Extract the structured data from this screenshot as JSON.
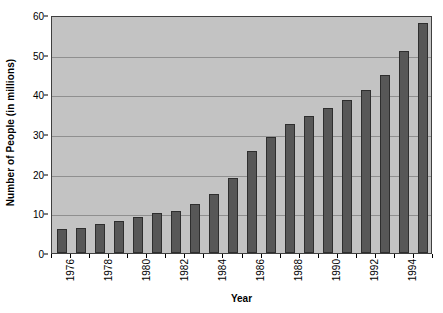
{
  "chart_data": {
    "type": "bar",
    "title": "",
    "xlabel": "Year",
    "ylabel": "Number of People (in millions)",
    "categories": [
      "1976",
      "1977",
      "1978",
      "1979",
      "1980",
      "1981",
      "1982",
      "1983",
      "1984",
      "1985",
      "1986",
      "1987",
      "1988",
      "1989",
      "1990",
      "1991",
      "1992",
      "1993",
      "1994",
      "1995"
    ],
    "values": [
      6.0,
      6.3,
      7.3,
      8.0,
      9.0,
      10.0,
      10.6,
      12.3,
      15.0,
      19.0,
      25.6,
      29.3,
      32.6,
      34.6,
      36.5,
      38.5,
      41.2,
      45.0,
      51.0,
      58.0
    ],
    "ylim": [
      0,
      60
    ],
    "y_ticks": [
      0,
      10,
      20,
      30,
      40,
      50,
      60
    ],
    "y_tick_labels": [
      "0",
      "10",
      "20",
      "30",
      "40",
      "50",
      "60"
    ],
    "x_tick_labels_shown": [
      "1976",
      "1978",
      "1980",
      "1982",
      "1984",
      "1986",
      "1988",
      "1990",
      "1992",
      "1994"
    ],
    "x_tick_label_indices": [
      0,
      2,
      4,
      6,
      8,
      10,
      12,
      14,
      16,
      18
    ],
    "grid": true,
    "legend": null,
    "legend_position": "none",
    "colors": {
      "bar_fill": "#575757",
      "bar_border": "#2e2e2e",
      "plot_background": "#c3c3c3",
      "plot_border": "#3f3f3f",
      "gridline": "#8f8f8f",
      "text": "#000000",
      "page_background": "#ffffff"
    }
  }
}
